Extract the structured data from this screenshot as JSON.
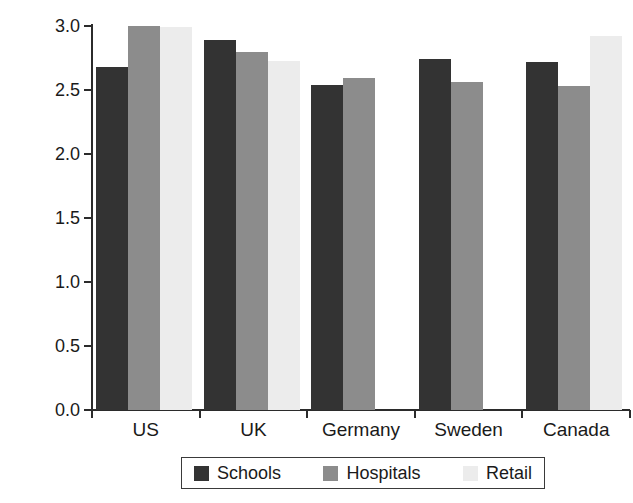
{
  "chart_data": {
    "type": "bar",
    "title": "",
    "subtitle": "",
    "xlabel": "",
    "ylabel": "Management score",
    "ylim": [
      0.0,
      3.0
    ],
    "yticks": [
      "0.0",
      "0.5",
      "1.0",
      "1.5",
      "2.0",
      "2.5",
      "3.0"
    ],
    "ytick_values": [
      0.0,
      0.5,
      1.0,
      1.5,
      2.0,
      2.5,
      3.0
    ],
    "grid": false,
    "legend_position": "bottom",
    "categories": [
      "US",
      "UK",
      "Germany",
      "Sweden",
      "Canada"
    ],
    "series": [
      {
        "name": "Schools",
        "color": "#333333",
        "values": [
          2.68,
          2.89,
          2.54,
          2.74,
          2.72
        ]
      },
      {
        "name": "Hospitals",
        "color": "#8c8c8c",
        "values": [
          3.0,
          2.8,
          2.59,
          2.56,
          2.53
        ]
      },
      {
        "name": "Retail",
        "color": "#ececec",
        "values": [
          2.99,
          2.73,
          null,
          null,
          2.92
        ]
      }
    ],
    "annotations": []
  },
  "legend": {
    "items": [
      {
        "label": "Schools",
        "swatch": "schools-swatch"
      },
      {
        "label": "Hospitals",
        "swatch": "hospitals-swatch"
      },
      {
        "label": "Retail",
        "swatch": "retail-swatch"
      }
    ]
  },
  "axes": {
    "y_title": "Management score"
  }
}
